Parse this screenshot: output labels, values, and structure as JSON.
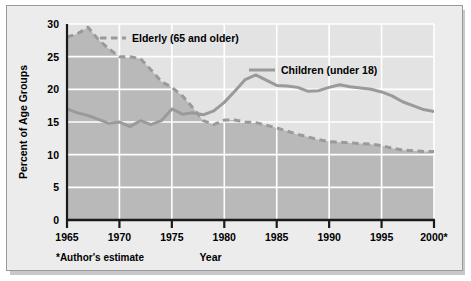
{
  "figure": {
    "background_color": "#ececed",
    "plot_fill_upper": "#e3e3e3",
    "plot_fill_lower": "#b9b9b9",
    "series_color": "#9a9a9a",
    "gridline_color": "#ffffff",
    "axis_color": "#1a1a1a",
    "footnote": "*Author's estimate"
  },
  "chart_data": {
    "type": "line",
    "title": "",
    "xlabel": "Year",
    "ylabel": "Percent of Age Groups",
    "xlim": [
      1965,
      2000
    ],
    "ylim": [
      0,
      30
    ],
    "xticks": [
      1965,
      1970,
      1975,
      1980,
      1985,
      1990,
      1995,
      2000
    ],
    "xticklabels": [
      "1965",
      "1970",
      "1975",
      "1980",
      "1985",
      "1990",
      "1995",
      "2000*"
    ],
    "yticks": [
      0,
      5,
      10,
      15,
      20,
      25,
      30
    ],
    "yticklabels": [
      "0",
      "5",
      "10",
      "15",
      "20",
      "25",
      "30"
    ],
    "grid": true,
    "legend_position": "inside",
    "series": [
      {
        "name": "Elderly (65 and older)",
        "legend_label": "Elderly (65 and older)",
        "style": "dashed",
        "color": "#9a9a9a",
        "x": [
          1965,
          1966,
          1967,
          1968,
          1969,
          1970,
          1971,
          1972,
          1973,
          1974,
          1975,
          1976,
          1977,
          1978,
          1979,
          1980,
          1981,
          1982,
          1983,
          1984,
          1985,
          1986,
          1987,
          1988,
          1989,
          1990,
          1991,
          1992,
          1993,
          1994,
          1995,
          1996,
          1997,
          1998,
          1999,
          2000
        ],
        "values": [
          28.0,
          28.5,
          29.5,
          27.6,
          26.2,
          25.0,
          25.0,
          24.7,
          23.0,
          21.2,
          20.3,
          19.0,
          17.2,
          15.2,
          14.6,
          15.3,
          15.3,
          15.0,
          14.9,
          14.5,
          14.1,
          13.6,
          13.1,
          12.7,
          12.3,
          12.0,
          11.9,
          11.8,
          11.7,
          11.6,
          11.4,
          11.0,
          10.7,
          10.6,
          10.5,
          10.5
        ]
      },
      {
        "name": "Children (under 18)",
        "legend_label": "Children (under 18)",
        "style": "solid",
        "color": "#9a9a9a",
        "x": [
          1965,
          1966,
          1967,
          1968,
          1969,
          1970,
          1971,
          1972,
          1973,
          1974,
          1975,
          1976,
          1977,
          1978,
          1979,
          1980,
          1981,
          1982,
          1983,
          1984,
          1985,
          1986,
          1987,
          1988,
          1989,
          1990,
          1991,
          1992,
          1993,
          1994,
          1995,
          1996,
          1997,
          1998,
          1999,
          2000
        ],
        "values": [
          17.0,
          16.4,
          16.0,
          15.4,
          14.8,
          15.0,
          14.3,
          15.2,
          14.6,
          15.2,
          17.0,
          16.2,
          16.4,
          16.1,
          16.7,
          18.0,
          19.7,
          21.5,
          22.2,
          21.4,
          20.6,
          20.5,
          20.3,
          19.7,
          19.8,
          20.3,
          20.7,
          20.4,
          20.2,
          20.0,
          19.6,
          19.0,
          18.1,
          17.5,
          16.9,
          16.6
        ]
      }
    ]
  }
}
